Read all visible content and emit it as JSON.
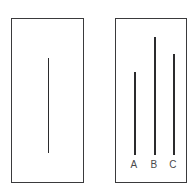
{
  "figure": {
    "title": "Line Judgment Task",
    "description": "Two white cards side by side. The left card shows a single reference line. The right card shows three comparison lines of differing lengths labeled A, B and C.",
    "background_color": "#ffffff",
    "card_border_color": "#3a3a3c",
    "line_color": "#2b2b2d",
    "label_color": "#4a4a4c"
  },
  "reference_card": {
    "name": "reference-card",
    "x": 11,
    "y": 18,
    "width": 73,
    "height": 165,
    "line": {
      "id": "reference",
      "label": "",
      "x": 48,
      "top": 58,
      "bottom": 153,
      "length": 95
    }
  },
  "comparison_card": {
    "name": "comparison-card",
    "x": 115,
    "y": 18,
    "width": 72,
    "height": 165,
    "lines": [
      {
        "id": "A",
        "label": "A",
        "x": 134,
        "top": 72,
        "bottom": 155,
        "length": 83,
        "label_x": 127,
        "label_y": 160
      },
      {
        "id": "B",
        "label": "B",
        "x": 154,
        "top": 37,
        "bottom": 155,
        "length": 118,
        "label_x": 147,
        "label_y": 160
      },
      {
        "id": "C",
        "label": "C",
        "x": 173,
        "top": 54,
        "bottom": 155,
        "length": 101,
        "label_x": 166,
        "label_y": 160
      }
    ]
  },
  "chart_data": {
    "type": "bar",
    "title": "Line Judgment Task",
    "subtitle": "",
    "xlabel": "",
    "ylabel": "Line length (px)",
    "orientation": "vertical",
    "grid": false,
    "legend": false,
    "categories": [
      "Reference",
      "A",
      "B",
      "C"
    ],
    "values": [
      95,
      83,
      118,
      101
    ],
    "ylim": [
      0,
      125
    ],
    "annotations": [
      "A",
      "B",
      "C"
    ]
  }
}
